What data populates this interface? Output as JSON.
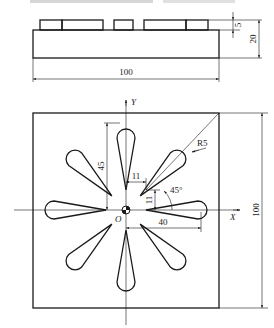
{
  "front_view": {
    "dim_width": "100",
    "dim_height_total": "20",
    "dim_height_boss": "5"
  },
  "plan_view": {
    "axis_x_label": "X",
    "axis_y_label": "Y",
    "origin_label": "O",
    "dim_width": "100",
    "dim_petal_length": "45",
    "dim_offset_x": "11",
    "dim_offset_y": "11",
    "dim_radial": "40",
    "dim_angle": "45°",
    "dim_radius": "R5"
  },
  "colors": {
    "line": "#1a1a1a",
    "background": "#ffffff"
  }
}
